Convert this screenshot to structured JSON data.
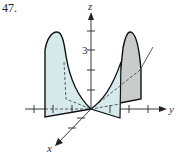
{
  "problem_number": "47.",
  "figure": {
    "type": "3d-surface-plot",
    "axes": {
      "x_label": "x",
      "y_label": "y",
      "z_label": "z",
      "z_tick_label": "3"
    },
    "colors": {
      "left_surface_fill": "#d6eaec",
      "right_surface_fill": "#c9cccd",
      "front_surface_fill": "#d6eaec",
      "outline": "#111111",
      "axis": "#222222"
    }
  }
}
